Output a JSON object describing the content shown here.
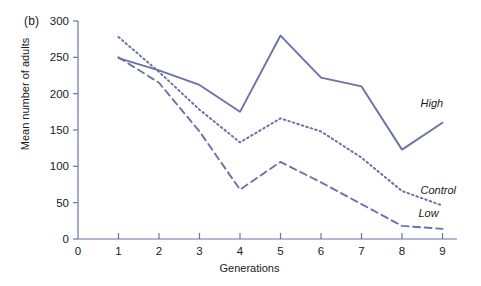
{
  "panel": {
    "label": "(b)"
  },
  "chart_data": {
    "type": "line",
    "title": "",
    "xlabel": "Generations",
    "ylabel": "Mean number of adults",
    "x": [
      1,
      2,
      3,
      4,
      5,
      6,
      7,
      8,
      9
    ],
    "categories": [
      "1",
      "2",
      "3",
      "4",
      "5",
      "6",
      "7",
      "8",
      "9"
    ],
    "xlim": [
      0,
      9.3
    ],
    "ylim": [
      0,
      300
    ],
    "xticks": [
      0,
      1,
      2,
      3,
      4,
      5,
      6,
      7,
      8,
      9
    ],
    "xticklabels": [
      "0",
      "1",
      "2",
      "3",
      "4",
      "5",
      "6",
      "7",
      "8",
      "9"
    ],
    "yticks": [
      0,
      50,
      100,
      150,
      200,
      250,
      300
    ],
    "yticklabels": [
      "0",
      "50",
      "100",
      "150",
      "200",
      "250",
      "300"
    ],
    "grid": false,
    "legend_position": "inline-right-annotations",
    "line_color": "#6b72a8",
    "series": [
      {
        "name": "High",
        "label": "High",
        "style": "solid",
        "color": "#6b72a8",
        "values": [
          249,
          232,
          212,
          175,
          280,
          222,
          210,
          123,
          160
        ]
      },
      {
        "name": "Control",
        "label": "Control",
        "style": "dotted",
        "color": "#6b72a8",
        "values": [
          278,
          230,
          178,
          133,
          166,
          148,
          112,
          66,
          46
        ]
      },
      {
        "name": "Low",
        "label": "Low",
        "style": "dashed",
        "color": "#6b72a8",
        "values": [
          250,
          215,
          148,
          68,
          106,
          78,
          48,
          18,
          14
        ]
      }
    ],
    "annotations": [
      {
        "text": "High",
        "series": "High",
        "x": 9,
        "y": 160
      },
      {
        "text": "Control",
        "series": "Control",
        "x": 9,
        "y": 46
      },
      {
        "text": "Low",
        "series": "Low",
        "x": 9,
        "y": 14
      }
    ]
  }
}
